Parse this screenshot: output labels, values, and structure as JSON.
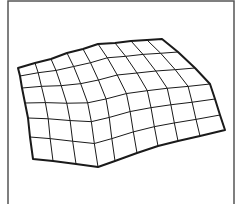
{
  "figure": {
    "background": "#ffffff",
    "frame_color": "#555555",
    "line_color": "#1a1a1a",
    "frame": {
      "left": 8,
      "top": 1,
      "right": 234,
      "bottom": 204
    },
    "grid": {
      "columns": 9,
      "rows": 6,
      "top_edge": [
        [
          18,
          68
        ],
        [
          35,
          63
        ],
        [
          51,
          59
        ],
        [
          67,
          53
        ],
        [
          83,
          49
        ],
        [
          98,
          44
        ],
        [
          115,
          43
        ],
        [
          131,
          41
        ],
        [
          147,
          40
        ],
        [
          162,
          39
        ]
      ],
      "bottom_edge": [
        [
          33,
          159
        ],
        [
          53,
          161
        ],
        [
          76,
          164
        ],
        [
          98,
          167
        ],
        [
          115,
          161
        ],
        [
          137,
          153
        ],
        [
          158,
          146
        ],
        [
          178,
          141
        ],
        [
          200,
          136
        ],
        [
          225,
          130
        ]
      ],
      "left_edge": [
        [
          18,
          68
        ],
        [
          20,
          76
        ],
        [
          22,
          88
        ],
        [
          25,
          103
        ],
        [
          28,
          118
        ],
        [
          30,
          137
        ],
        [
          33,
          159
        ]
      ],
      "right_edge": [
        [
          162,
          39
        ],
        [
          178,
          52
        ],
        [
          195,
          68
        ],
        [
          210,
          84
        ],
        [
          215,
          99
        ],
        [
          220,
          115
        ],
        [
          225,
          130
        ]
      ]
    }
  }
}
